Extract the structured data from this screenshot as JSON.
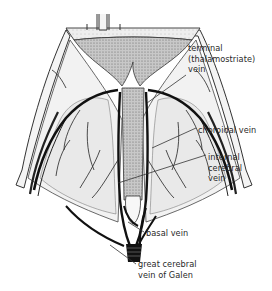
{
  "figure": {
    "labels": {
      "terminal_vein": "terminal\n(thalamostriate)\nvein",
      "choroidal_vein": "choroidal vein",
      "internal_cerebral_vein": "internal\ncerebral\nvein",
      "basal_vein": "basal vein",
      "great_cerebral_vein": "great cerebral\nvein of Galen"
    },
    "colors": {
      "ink": "#1a1a1a",
      "shading": "#9a9a9a",
      "background": "#ffffff"
    }
  }
}
